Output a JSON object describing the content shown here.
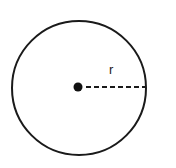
{
  "figure": {
    "name": "circle-radius-diagram",
    "background_color": "#ffffff",
    "width": 176,
    "height": 168
  },
  "labels": {
    "radius": "r"
  },
  "chart_data": {
    "type": "diagram",
    "title": "",
    "subtitle": "",
    "xlabel": "",
    "ylabel": "",
    "grid": false,
    "legend": false,
    "annotations": [
      {
        "name": "radius-label",
        "text": "r",
        "x": 113,
        "y": 70
      }
    ],
    "shapes": [
      {
        "name": "outer-circle",
        "type": "circle",
        "cx": 79,
        "cy": 88,
        "r": 67,
        "stroke": "#1a1a1a",
        "stroke_width": 2,
        "fill": "none"
      },
      {
        "name": "center-point",
        "type": "circle",
        "cx": 78,
        "cy": 87,
        "r": 4.5,
        "stroke": "none",
        "stroke_width": 0,
        "fill": "#111111"
      },
      {
        "name": "radius-line",
        "type": "line",
        "x1": 86,
        "y1": 87,
        "x2": 145,
        "y2": 87,
        "stroke": "#1a1a1a",
        "stroke_width": 2,
        "dash": "5,3"
      }
    ]
  }
}
